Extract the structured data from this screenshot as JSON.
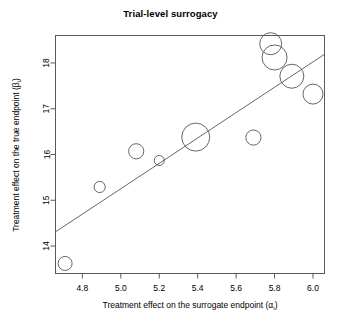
{
  "chart_data": {
    "type": "scatter",
    "title": "Trial-level surrogacy",
    "xlabel": "Treatment effect on the surrogate endpoint (αᵢ)",
    "xlabel_main": "Treatment effect on the surrogate endpoint (",
    "xlabel_symbol": "α",
    "xlabel_subscript": "i",
    "xlabel_close": ")",
    "ylabel": "Treatment effect on the true endpoint (βᵢ)",
    "ylabel_main": "Treatment effect on the true endpoint (",
    "ylabel_symbol": "β",
    "ylabel_subscript": "i",
    "ylabel_close": ")",
    "xlim": [
      4.66,
      6.06
    ],
    "ylim": [
      13.4,
      18.6
    ],
    "xticks": [
      4.8,
      5.0,
      5.2,
      5.4,
      5.6,
      5.8,
      6.0
    ],
    "xticklabels": [
      "4.8",
      "5.0",
      "5.2",
      "5.4",
      "5.6",
      "5.8",
      "6.0"
    ],
    "yticks": [
      14,
      15,
      16,
      17,
      18
    ],
    "yticklabels": [
      "14",
      "15",
      "16",
      "17",
      "18"
    ],
    "grid": false,
    "legend": false,
    "marker": "open-circle",
    "marker_color": "#555555",
    "points": [
      {
        "x": 4.71,
        "y": 13.62,
        "size": 7.0
      },
      {
        "x": 4.89,
        "y": 15.29,
        "size": 5.6
      },
      {
        "x": 5.08,
        "y": 16.07,
        "size": 7.6
      },
      {
        "x": 5.2,
        "y": 15.87,
        "size": 5.0
      },
      {
        "x": 5.39,
        "y": 16.38,
        "size": 14.0
      },
      {
        "x": 5.69,
        "y": 16.37,
        "size": 7.6
      },
      {
        "x": 5.78,
        "y": 18.42,
        "size": 11.0
      },
      {
        "x": 5.8,
        "y": 18.12,
        "size": 12.5
      },
      {
        "x": 5.89,
        "y": 17.71,
        "size": 12.0
      },
      {
        "x": 6.0,
        "y": 17.32,
        "size": 10.0
      }
    ],
    "fit_line": {
      "label": "regression line",
      "x1": 4.66,
      "y1": 14.31,
      "x2": 6.06,
      "y2": 18.19
    }
  }
}
